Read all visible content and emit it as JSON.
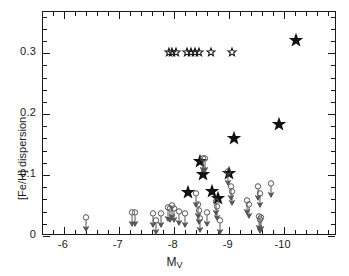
{
  "figure": {
    "background_color": "#ffffff",
    "frame_color": "#1a1a1a",
    "marker_color_filled": "#111111",
    "marker_color_limit": "#555555"
  },
  "axes": {
    "x_title_main": "M",
    "x_title_sub": "V",
    "y_title": "[Fe/H] dispersion",
    "x_ticklabels": [
      "-6",
      "-7",
      "-8",
      "-9",
      "-10"
    ],
    "y_ticklabels": [
      "0.3",
      "0.2",
      "0.1",
      "0"
    ]
  },
  "chart_data": {
    "type": "scatter",
    "title": "",
    "xlabel": "M_V",
    "ylabel": "[Fe/H] dispersion",
    "xlim": [
      -5.62,
      -10.97
    ],
    "ylim": [
      0.0,
      0.3675
    ],
    "x_ticks": [
      -6,
      -7,
      -8,
      -9,
      -10
    ],
    "y_ticks": [
      0.0,
      0.1,
      0.2,
      0.3
    ],
    "x_minor_tick_step": 0.2,
    "y_minor_tick_step": 0.02,
    "x_axis_inverted": true,
    "grid": false,
    "legend": null,
    "series": [
      {
        "name": "Globular clusters with measured dispersion",
        "marker": "filled-star",
        "points": [
          {
            "x": -8.28,
            "y": 0.071
          },
          {
            "x": -8.55,
            "y": 0.1
          },
          {
            "x": -8.72,
            "y": 0.072
          },
          {
            "x": -8.5,
            "y": 0.121
          },
          {
            "x": -8.82,
            "y": 0.061
          },
          {
            "x": -9.02,
            "y": 0.101
          },
          {
            "x": -9.12,
            "y": 0.16
          },
          {
            "x": -9.93,
            "y": 0.182
          },
          {
            "x": -10.25,
            "y": 0.32
          }
        ]
      },
      {
        "name": "Clusters plotted at top boundary (small open stars)",
        "marker": "open-star",
        "points": [
          {
            "x": -7.93,
            "y": 0.301
          },
          {
            "x": -7.98,
            "y": 0.301
          },
          {
            "x": -8.05,
            "y": 0.301
          },
          {
            "x": -8.25,
            "y": 0.301
          },
          {
            "x": -8.33,
            "y": 0.301
          },
          {
            "x": -8.4,
            "y": 0.301
          },
          {
            "x": -8.47,
            "y": 0.301
          },
          {
            "x": -8.7,
            "y": 0.301
          },
          {
            "x": -9.07,
            "y": 0.301
          }
        ]
      },
      {
        "name": "Upper limits",
        "marker": "circle-with-down-arrow",
        "points": [
          {
            "x": -6.42,
            "y": 0.029
          },
          {
            "x": -7.25,
            "y": 0.037
          },
          {
            "x": -7.32,
            "y": 0.037
          },
          {
            "x": -7.63,
            "y": 0.036
          },
          {
            "x": -7.7,
            "y": 0.024
          },
          {
            "x": -7.78,
            "y": 0.036
          },
          {
            "x": -7.92,
            "y": 0.046
          },
          {
            "x": -7.95,
            "y": 0.044
          },
          {
            "x": -7.99,
            "y": 0.048
          },
          {
            "x": -8.02,
            "y": 0.043
          },
          {
            "x": -8.12,
            "y": 0.038
          },
          {
            "x": -8.22,
            "y": 0.036
          },
          {
            "x": -8.43,
            "y": 0.068
          },
          {
            "x": -8.46,
            "y": 0.051
          },
          {
            "x": -8.48,
            "y": 0.04
          },
          {
            "x": -8.5,
            "y": 0.027
          },
          {
            "x": -8.55,
            "y": 0.125
          },
          {
            "x": -8.58,
            "y": 0.126
          },
          {
            "x": -8.63,
            "y": 0.037
          },
          {
            "x": -8.78,
            "y": 0.056
          },
          {
            "x": -8.8,
            "y": 0.047
          },
          {
            "x": -8.85,
            "y": 0.024
          },
          {
            "x": -9.0,
            "y": 0.104
          },
          {
            "x": -9.05,
            "y": 0.079
          },
          {
            "x": -9.08,
            "y": 0.071
          },
          {
            "x": -9.35,
            "y": 0.057
          },
          {
            "x": -9.38,
            "y": 0.051
          },
          {
            "x": -9.55,
            "y": 0.079
          },
          {
            "x": -9.58,
            "y": 0.069
          },
          {
            "x": -9.56,
            "y": 0.03
          },
          {
            "x": -9.58,
            "y": 0.026
          },
          {
            "x": -9.6,
            "y": 0.029
          },
          {
            "x": -9.78,
            "y": 0.084
          }
        ]
      }
    ]
  }
}
